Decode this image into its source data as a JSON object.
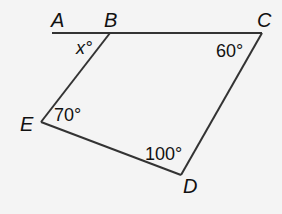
{
  "diagram": {
    "title": "",
    "points": {
      "A": {
        "label": "A"
      },
      "B": {
        "label": "B"
      },
      "C": {
        "label": "C"
      },
      "D": {
        "label": "D"
      },
      "E": {
        "label": "E"
      }
    },
    "angles": {
      "B": {
        "label": "x°"
      },
      "C": {
        "label": "60°"
      },
      "E": {
        "label": "70°"
      },
      "D": {
        "label": "100°"
      }
    },
    "colors": {
      "line": "#333333",
      "background": "#f4f4f4"
    }
  }
}
